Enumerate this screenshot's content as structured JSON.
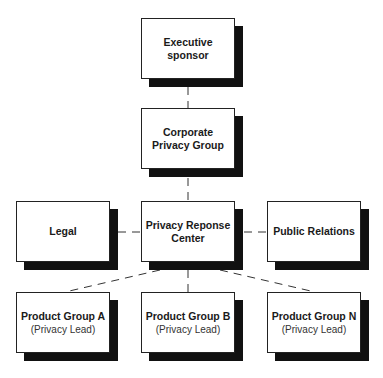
{
  "diagram": {
    "type": "org-chart",
    "nodes": {
      "executive": {
        "title_line1": "Executive",
        "title_line2": "sponsor"
      },
      "corporate": {
        "title_line1": "Corporate",
        "title_line2": "Privacy Group"
      },
      "legal": {
        "title": "Legal"
      },
      "prc": {
        "title_line1": "Privacy Reponse",
        "title_line2": "Center"
      },
      "pr": {
        "title": "Public Relations"
      },
      "pga": {
        "title": "Product Group A",
        "subtitle": "(Privacy Lead)"
      },
      "pgb": {
        "title": "Product Group B",
        "subtitle": "(Privacy Lead)"
      },
      "pgn": {
        "title": "Product Group N",
        "subtitle": "(Privacy Lead)"
      }
    },
    "edges": [
      [
        "executive",
        "corporate"
      ],
      [
        "corporate",
        "prc"
      ],
      [
        "legal",
        "prc"
      ],
      [
        "prc",
        "pr"
      ],
      [
        "prc",
        "pga"
      ],
      [
        "prc",
        "pgb"
      ],
      [
        "prc",
        "pgn"
      ]
    ],
    "edge_style": "dashed"
  }
}
